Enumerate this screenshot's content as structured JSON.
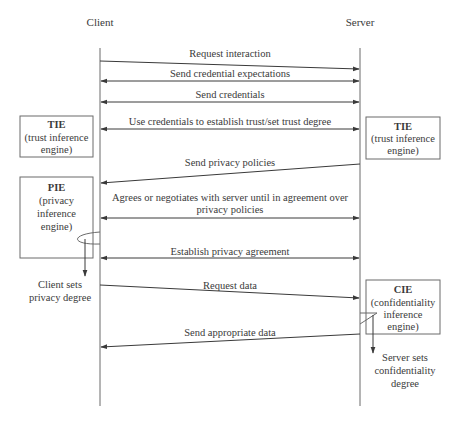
{
  "diagram": {
    "type": "sequence",
    "lifelines": [
      {
        "id": "client",
        "label": "Client",
        "x": 100
      },
      {
        "id": "server",
        "label": "Server",
        "x": 360
      }
    ],
    "messages": [
      {
        "label": "Request interaction",
        "from": "client",
        "to": "server",
        "y_start": 61,
        "y_end": 69,
        "label_y": 57,
        "double": false
      },
      {
        "label": "Send credential expectations",
        "from": "server",
        "to": "client",
        "y_start": 81,
        "y_end": 81,
        "label_y": 77,
        "double": true
      },
      {
        "label": "Send credentials",
        "from": "server",
        "to": "client",
        "y_start": 102,
        "y_end": 102,
        "label_y": 98,
        "double": true
      },
      {
        "label": "Use credentials to establish trust/set trust degree",
        "from": "server",
        "to": "client",
        "y_start": 129,
        "y_end": 129,
        "label_y": 125,
        "double": true
      },
      {
        "label": "Send privacy policies",
        "from": "server",
        "to": "client",
        "y_start": 164,
        "y_end": 183,
        "label_y": 166,
        "double": false
      },
      {
        "label": "Agrees or negotiates with server until in agreement over",
        "label2": "privacy policies",
        "from": "server",
        "to": "client",
        "y_start": 218,
        "y_end": 218,
        "label_y": 201,
        "double": true
      },
      {
        "label": "Establish privacy agreement",
        "from": "server",
        "to": "client",
        "y_start": 258,
        "y_end": 258,
        "label_y": 255,
        "double": true
      },
      {
        "label": "Request data",
        "from": "client",
        "to": "server",
        "y_start": 285,
        "y_end": 298,
        "label_y": 289,
        "double": false
      },
      {
        "label": "Send appropriate data",
        "from": "server",
        "to": "client",
        "y_start": 334,
        "y_end": 347,
        "label_y": 336,
        "double": false
      }
    ],
    "engines": [
      {
        "id": "tie-client",
        "title": "TIE",
        "lines": [
          "(trust inference",
          "engine)"
        ],
        "x": 20,
        "y": 116,
        "w": 73,
        "h": 41
      },
      {
        "id": "tie-server",
        "title": "TIE",
        "lines": [
          "(trust inference",
          "engine)"
        ],
        "x": 366,
        "y": 117,
        "w": 74,
        "h": 42
      },
      {
        "id": "pie-client",
        "title": "PIE",
        "lines": [
          "(privacy",
          "inference",
          "engine)"
        ],
        "x": 20,
        "y": 177,
        "w": 73,
        "h": 81
      },
      {
        "id": "cie-server",
        "title": "CIE",
        "lines": [
          "(confidentiality",
          "inference",
          "engine)"
        ],
        "x": 366,
        "y": 280,
        "w": 74,
        "h": 54
      }
    ],
    "notes": [
      {
        "id": "client-sets-privacy",
        "lines": [
          "Client sets",
          "privacy degree"
        ],
        "x": 60,
        "y": 288
      },
      {
        "id": "server-sets-confidentiality",
        "lines": [
          "Server sets",
          "confidentiality",
          "degree"
        ],
        "x": 393,
        "y": 360
      }
    ],
    "colors": {
      "line": "#3a3a3a",
      "box": "#6b6b6b",
      "text": "#3a3a3a",
      "background": "#ffffff"
    }
  }
}
